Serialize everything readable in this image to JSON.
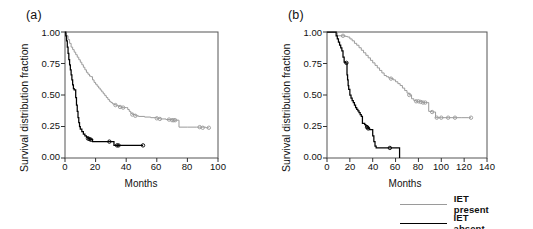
{
  "figure": {
    "panels": [
      {
        "label": "(a)",
        "xlabel": "Months",
        "ylabel": "Survival distribution fraction",
        "xticks": [
          "0",
          "20",
          "40",
          "60",
          "80",
          "100"
        ],
        "yticks": [
          "0.00",
          "0.25",
          "0.50",
          "0.75",
          "1.00"
        ]
      },
      {
        "label": "(b)",
        "xlabel": "Months",
        "ylabel": "Survival distribution fraction",
        "xticks": [
          "0",
          "20",
          "40",
          "60",
          "80",
          "100",
          "120",
          "140"
        ],
        "yticks": [
          "0.00",
          "0.25",
          "0.50",
          "0.75",
          "1.00"
        ]
      }
    ]
  },
  "legend": {
    "position": "bottom-right",
    "items": [
      {
        "label": "IET present",
        "color": "#9a9a9a"
      },
      {
        "label": "IET absent",
        "color": "#000000"
      }
    ]
  },
  "chart_data": [
    {
      "type": "line",
      "title": "(a)",
      "xlabel": "Months",
      "ylabel": "Survival distribution fraction",
      "xlim": [
        0,
        100
      ],
      "ylim": [
        0,
        1
      ],
      "xticks": [
        0,
        20,
        40,
        60,
        80,
        100
      ],
      "yticks": [
        0.0,
        0.25,
        0.5,
        0.75,
        1.0
      ],
      "grid": false,
      "legend_position": "external-bottom-right",
      "series": [
        {
          "name": "IET present",
          "color": "#9a9a9a",
          "step": "post",
          "points": [
            [
              0,
              1.0
            ],
            [
              1,
              0.97
            ],
            [
              2,
              0.94
            ],
            [
              3,
              0.91
            ],
            [
              4,
              0.88
            ],
            [
              5,
              0.86
            ],
            [
              6,
              0.84
            ],
            [
              7,
              0.82
            ],
            [
              8,
              0.8
            ],
            [
              9,
              0.78
            ],
            [
              10,
              0.76
            ],
            [
              11,
              0.74
            ],
            [
              12,
              0.72
            ],
            [
              13,
              0.7
            ],
            [
              14,
              0.68
            ],
            [
              15,
              0.665
            ],
            [
              16,
              0.65
            ],
            [
              17,
              0.645
            ],
            [
              18,
              0.62
            ],
            [
              19,
              0.6
            ],
            [
              20,
              0.585
            ],
            [
              21,
              0.57
            ],
            [
              22,
              0.555
            ],
            [
              23,
              0.54
            ],
            [
              24,
              0.525
            ],
            [
              25,
              0.51
            ],
            [
              26,
              0.495
            ],
            [
              27,
              0.48
            ],
            [
              28,
              0.465
            ],
            [
              29,
              0.45
            ],
            [
              30,
              0.44
            ],
            [
              31,
              0.43
            ],
            [
              32,
              0.425
            ],
            [
              33,
              0.42
            ],
            [
              34,
              0.415
            ],
            [
              35,
              0.41
            ],
            [
              36,
              0.405
            ],
            [
              37,
              0.4
            ],
            [
              38,
              0.4
            ],
            [
              39,
              0.4
            ],
            [
              40,
              0.4
            ],
            [
              41,
              0.385
            ],
            [
              42,
              0.37
            ],
            [
              43,
              0.355
            ],
            [
              44,
              0.345
            ],
            [
              46,
              0.335
            ],
            [
              48,
              0.33
            ],
            [
              52,
              0.325
            ],
            [
              56,
              0.32
            ],
            [
              60,
              0.315
            ],
            [
              62,
              0.31
            ],
            [
              66,
              0.305
            ],
            [
              70,
              0.3
            ],
            [
              72,
              0.3
            ],
            [
              74,
              0.3
            ],
            [
              74.5,
              0.245
            ],
            [
              80,
              0.245
            ],
            [
              86,
              0.245
            ],
            [
              88,
              0.245
            ],
            [
              92,
              0.24
            ],
            [
              94,
              0.24
            ]
          ],
          "censored": [
            [
              33,
              0.42
            ],
            [
              36,
              0.405
            ],
            [
              38,
              0.4
            ],
            [
              44,
              0.345
            ],
            [
              46,
              0.335
            ],
            [
              60,
              0.315
            ],
            [
              62,
              0.31
            ],
            [
              68,
              0.305
            ],
            [
              70,
              0.3
            ],
            [
              71,
              0.3
            ],
            [
              72,
              0.3
            ],
            [
              88,
              0.245
            ],
            [
              90,
              0.24
            ],
            [
              94,
              0.24
            ]
          ]
        },
        {
          "name": "IET absent",
          "color": "#000000",
          "step": "post",
          "points": [
            [
              0,
              1.0
            ],
            [
              0.5,
              0.97
            ],
            [
              1,
              0.93
            ],
            [
              1.5,
              0.88
            ],
            [
              2,
              0.83
            ],
            [
              2.5,
              0.78
            ],
            [
              3,
              0.74
            ],
            [
              3.5,
              0.7
            ],
            [
              4,
              0.66
            ],
            [
              4.5,
              0.62
            ],
            [
              5,
              0.58
            ],
            [
              5.5,
              0.55
            ],
            [
              6,
              0.54
            ],
            [
              6.5,
              0.54
            ],
            [
              7,
              0.48
            ],
            [
              7.5,
              0.42
            ],
            [
              8,
              0.37
            ],
            [
              8.5,
              0.32
            ],
            [
              9,
              0.28
            ],
            [
              9.5,
              0.25
            ],
            [
              10,
              0.23
            ],
            [
              11,
              0.21
            ],
            [
              12,
              0.19
            ],
            [
              13,
              0.175
            ],
            [
              14,
              0.165
            ],
            [
              15,
              0.155
            ],
            [
              16,
              0.15
            ],
            [
              17,
              0.145
            ],
            [
              18,
              0.13
            ],
            [
              20,
              0.13
            ],
            [
              24,
              0.13
            ],
            [
              28,
              0.13
            ],
            [
              29,
              0.13
            ],
            [
              31,
              0.13
            ],
            [
              32,
              0.1
            ],
            [
              34,
              0.1
            ],
            [
              35,
              0.1
            ],
            [
              40,
              0.1
            ],
            [
              45,
              0.1
            ],
            [
              50,
              0.1
            ],
            [
              51,
              0.1
            ]
          ],
          "censored": [
            [
              15,
              0.155
            ],
            [
              16,
              0.15
            ],
            [
              17,
              0.145
            ],
            [
              29,
              0.13
            ],
            [
              34,
              0.1
            ],
            [
              35,
              0.1
            ],
            [
              51,
              0.1
            ]
          ]
        }
      ]
    },
    {
      "type": "line",
      "title": "(b)",
      "xlabel": "Months",
      "ylabel": "Survival distribution fraction",
      "xlim": [
        0,
        140
      ],
      "ylim": [
        0,
        1
      ],
      "xticks": [
        0,
        20,
        40,
        60,
        80,
        100,
        120,
        140
      ],
      "yticks": [
        0.0,
        0.25,
        0.5,
        0.75,
        1.0
      ],
      "grid": false,
      "legend_position": "external-bottom-right",
      "series": [
        {
          "name": "IET present",
          "color": "#9a9a9a",
          "step": "post",
          "points": [
            [
              0,
              1.0
            ],
            [
              8,
              1.0
            ],
            [
              9,
              0.97
            ],
            [
              14,
              0.97
            ],
            [
              16,
              0.965
            ],
            [
              18,
              0.96
            ],
            [
              20,
              0.945
            ],
            [
              22,
              0.93
            ],
            [
              24,
              0.91
            ],
            [
              26,
              0.895
            ],
            [
              28,
              0.875
            ],
            [
              30,
              0.855
            ],
            [
              32,
              0.835
            ],
            [
              34,
              0.815
            ],
            [
              36,
              0.795
            ],
            [
              38,
              0.775
            ],
            [
              40,
              0.755
            ],
            [
              42,
              0.735
            ],
            [
              44,
              0.715
            ],
            [
              46,
              0.695
            ],
            [
              48,
              0.675
            ],
            [
              50,
              0.655
            ],
            [
              52,
              0.645
            ],
            [
              54,
              0.635
            ],
            [
              56,
              0.63
            ],
            [
              58,
              0.62
            ],
            [
              60,
              0.605
            ],
            [
              62,
              0.59
            ],
            [
              64,
              0.575
            ],
            [
              66,
              0.555
            ],
            [
              68,
              0.535
            ],
            [
              70,
              0.515
            ],
            [
              72,
              0.5
            ],
            [
              74,
              0.47
            ],
            [
              76,
              0.455
            ],
            [
              78,
              0.45
            ],
            [
              80,
              0.45
            ],
            [
              82,
              0.445
            ],
            [
              84,
              0.44
            ],
            [
              86,
              0.44
            ],
            [
              88,
              0.44
            ],
            [
              89,
              0.37
            ],
            [
              92,
              0.365
            ],
            [
              94,
              0.365
            ],
            [
              95,
              0.32
            ],
            [
              100,
              0.32
            ],
            [
              106,
              0.32
            ],
            [
              112,
              0.32
            ],
            [
              118,
              0.32
            ],
            [
              124,
              0.32
            ],
            [
              126,
              0.32
            ]
          ],
          "censored": [
            [
              14,
              0.97
            ],
            [
              56,
              0.63
            ],
            [
              72,
              0.5
            ],
            [
              78,
              0.45
            ],
            [
              80,
              0.45
            ],
            [
              82,
              0.445
            ],
            [
              84,
              0.44
            ],
            [
              86,
              0.44
            ],
            [
              92,
              0.365
            ],
            [
              96,
              0.32
            ],
            [
              100,
              0.32
            ],
            [
              106,
              0.32
            ],
            [
              112,
              0.32
            ],
            [
              126,
              0.32
            ]
          ]
        },
        {
          "name": "IET absent",
          "color": "#000000",
          "step": "post",
          "points": [
            [
              0,
              1.0
            ],
            [
              7,
              1.0
            ],
            [
              8,
              0.97
            ],
            [
              9,
              0.945
            ],
            [
              10,
              0.92
            ],
            [
              11,
              0.895
            ],
            [
              12,
              0.875
            ],
            [
              13,
              0.85
            ],
            [
              14,
              0.8
            ],
            [
              15,
              0.76
            ],
            [
              16,
              0.755
            ],
            [
              17,
              0.755
            ],
            [
              17.5,
              0.66
            ],
            [
              18,
              0.62
            ],
            [
              18.5,
              0.575
            ],
            [
              19,
              0.545
            ],
            [
              20,
              0.5
            ],
            [
              21,
              0.475
            ],
            [
              22,
              0.455
            ],
            [
              23,
              0.44
            ],
            [
              24,
              0.42
            ],
            [
              25,
              0.4
            ],
            [
              26,
              0.385
            ],
            [
              27,
              0.375
            ],
            [
              28,
              0.36
            ],
            [
              29,
              0.345
            ],
            [
              30,
              0.33
            ],
            [
              31,
              0.275
            ],
            [
              33,
              0.265
            ],
            [
              34,
              0.255
            ],
            [
              35,
              0.245
            ],
            [
              36,
              0.235
            ],
            [
              37,
              0.225
            ],
            [
              38,
              0.225
            ],
            [
              39,
              0.225
            ],
            [
              40,
              0.175
            ],
            [
              41,
              0.13
            ],
            [
              42,
              0.095
            ],
            [
              43,
              0.08
            ],
            [
              46,
              0.08
            ],
            [
              50,
              0.08
            ],
            [
              55,
              0.08
            ],
            [
              60,
              0.08
            ],
            [
              63,
              0.08
            ],
            [
              63.5,
              0.0
            ]
          ],
          "censored": [
            [
              17,
              0.755
            ],
            [
              35,
              0.245
            ],
            [
              36,
              0.235
            ],
            [
              55,
              0.08
            ]
          ]
        }
      ]
    }
  ]
}
